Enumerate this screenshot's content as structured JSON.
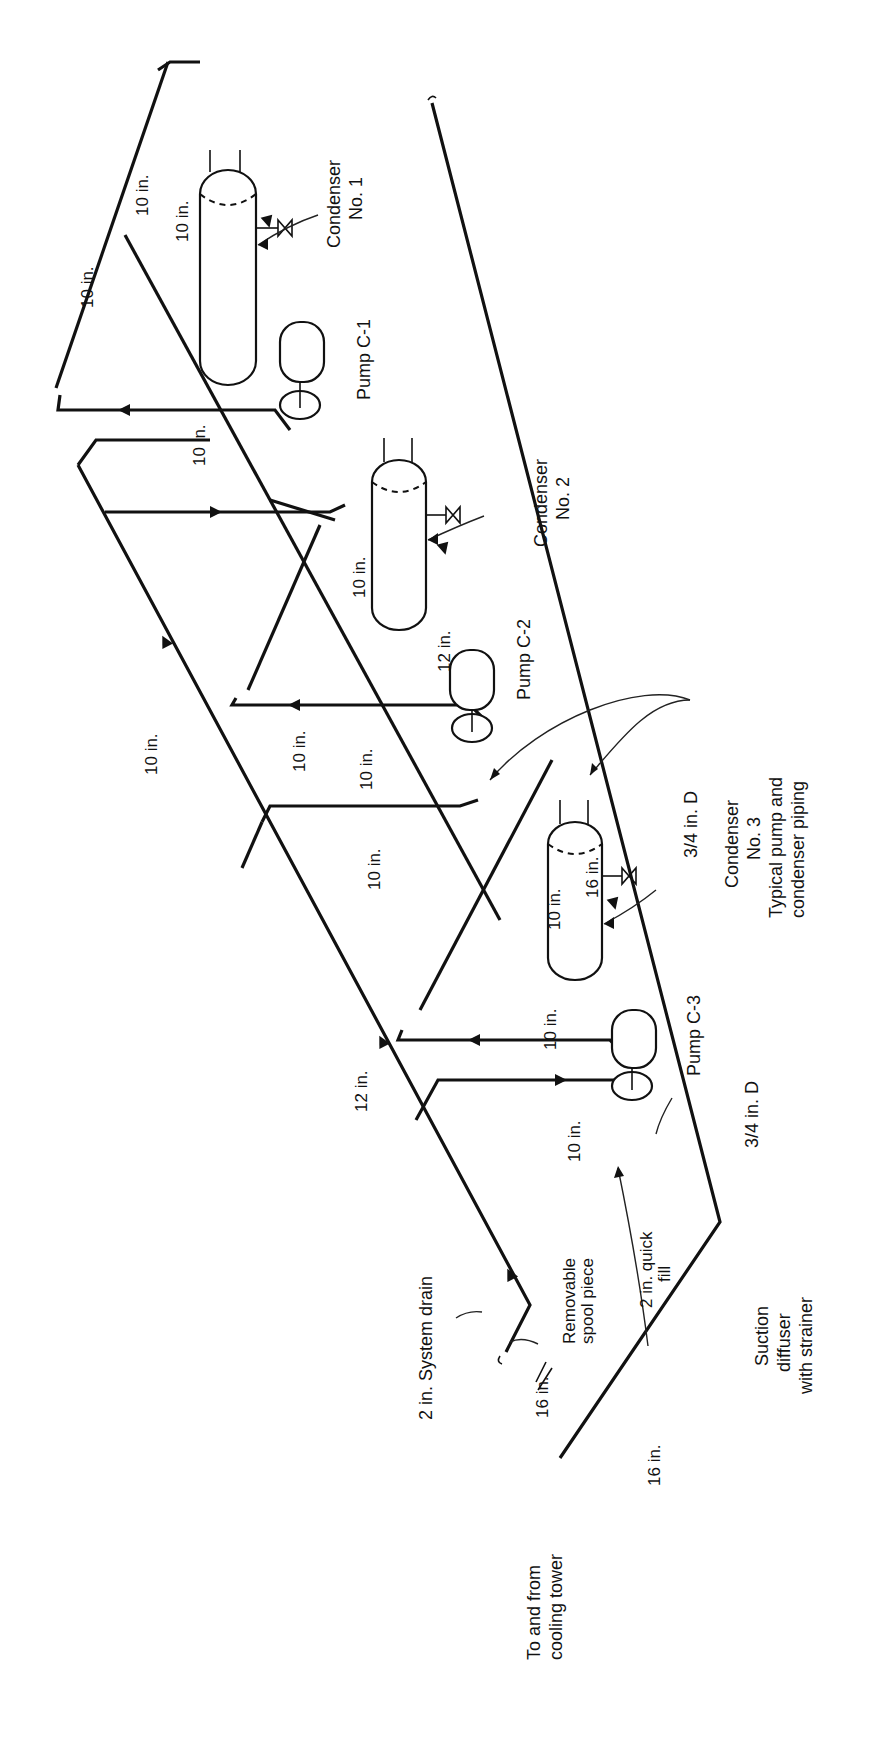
{
  "figure": {
    "type": "piping schematic"
  },
  "components": {
    "condensers": [
      {
        "id": "condenser-1",
        "label_line1": "Condenser",
        "label_line2": "No. 1"
      },
      {
        "id": "condenser-2",
        "label_line1": "Condenser",
        "label_line2": "No. 2"
      },
      {
        "id": "condenser-3",
        "label_line1": "Condenser",
        "label_line2": "No. 3"
      }
    ],
    "pumps": [
      {
        "id": "pump-c1",
        "label": "Pump C-1"
      },
      {
        "id": "pump-c2",
        "label": "Pump C-2"
      },
      {
        "id": "pump-c3",
        "label": "Pump C-3"
      }
    ]
  },
  "pipe_sizes": {
    "top_a": "10 in.",
    "top_b": "10 in.",
    "top_c": "10 in.",
    "c1_return": "10 in.",
    "c2_a": "10 in.",
    "c2_b": "12 in.",
    "c2_c": "10 in.",
    "c2_d": "10 in.",
    "header_10": "10 in.",
    "c3_a": "10 in.",
    "c3_b": "10 in.",
    "c3_c": "16 in.",
    "c3_d": "10 in.",
    "c3_e": "10 in.",
    "header_12": "12 in.",
    "supply_16": "16 in.",
    "return_16": "16 in."
  },
  "annotations": {
    "typical_line1": "Typical pump and",
    "typical_line2": "condenser piping",
    "valve_c3": "3/4 in. D",
    "valve_bottom": "3/4 in. D",
    "system_drain": "2 in.  System drain",
    "spool_line1": "Removable",
    "spool_line2": "spool piece",
    "quick_fill_line1": "2 in. quick",
    "quick_fill_line2": "fill",
    "suction_line1": "Suction",
    "suction_line2": "diffuser",
    "suction_line3": "with strainer",
    "cooling_tower_line1": "To and from",
    "cooling_tower_line2": "cooling tower"
  },
  "colors": {
    "ink": "#111111",
    "background": "#ffffff"
  }
}
